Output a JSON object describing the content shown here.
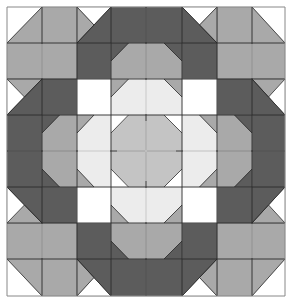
{
  "colors": {
    "white": "#ffffff",
    "light": "#ececec",
    "midlight": "#c4c4c4",
    "mid": "#a9a9a9",
    "dark": "#5c5c5c",
    "line": "#2a2a2a",
    "border": "#888888"
  },
  "grid": {
    "cols": [
      7,
      42,
      77,
      111,
      146,
      182,
      217,
      252,
      285
    ],
    "rows": [
      7,
      43,
      79,
      115,
      151,
      187,
      223,
      259,
      296
    ]
  },
  "blocks": [
    {
      "name": "corner-square",
      "position": "top-left",
      "pattern": "half-square-triangle",
      "colors": [
        "white",
        "mid"
      ]
    },
    {
      "name": "star-point",
      "position": "top",
      "pattern": "flying-geese",
      "colors": [
        "white",
        "mid",
        "dark"
      ]
    },
    {
      "name": "center-band",
      "position": "top-center",
      "pattern": "solid",
      "colors": [
        "dark"
      ]
    },
    {
      "name": "inner-ring",
      "position": "center",
      "pattern": "snowball",
      "colors": [
        "light",
        "midlight",
        "mid"
      ]
    },
    {
      "name": "center-octagon",
      "position": "center",
      "pattern": "octagon",
      "colors": [
        "midlight",
        "white"
      ]
    }
  ]
}
